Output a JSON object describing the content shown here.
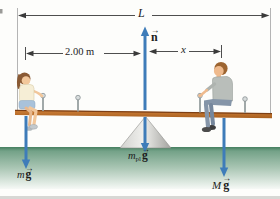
{
  "figure": {
    "labels": {
      "plank_length": "L",
      "normal_force": "n",
      "left_distance": "2.00 m",
      "right_distance": "x",
      "girl_mass": "m",
      "man_mass": "M",
      "plank_mass": "m",
      "plank_mass_sub": "pl",
      "gravity": "g",
      "vector_arrow": "→"
    },
    "colors": {
      "force_arrow": "#3e7cb9",
      "dimension_line": "#3a3a3a",
      "extension_line": "#b4b4b4",
      "plank_fill": "#c8792d",
      "plank_edge": "#7d3f14",
      "fulcrum_light": "#efefec",
      "fulcrum_dark": "#a3a39f",
      "ground_top": "#4b8465",
      "ground_fade": "#f6f9f6",
      "label_text": "#1c1c1c",
      "background": "#fdfdfb"
    }
  }
}
